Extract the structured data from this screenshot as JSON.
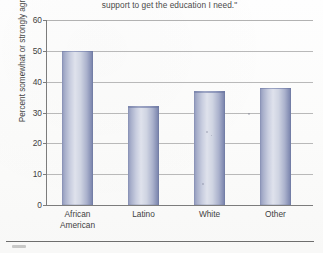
{
  "figure": {
    "title_fragment": "support to get the education I need.\"",
    "y_axis_title": "Percent somewhat or strongly agree"
  },
  "chart_data": {
    "type": "bar",
    "title": "support to get the education I need.\"",
    "xlabel": "",
    "ylabel": "Percent somewhat or strongly agree",
    "categories": [
      "African American",
      "Latino",
      "White",
      "Other"
    ],
    "category_lines": [
      [
        "African",
        "American"
      ],
      [
        "Latino"
      ],
      [
        "White"
      ],
      [
        "Other"
      ]
    ],
    "values": [
      50,
      32,
      37,
      38
    ],
    "ylim": [
      0,
      60
    ],
    "yticks": [
      0,
      10,
      20,
      30,
      40,
      50,
      60
    ],
    "ytick_labels": [
      "0",
      "10",
      "20",
      "30",
      "40",
      "50",
      "60"
    ],
    "grid": true,
    "legend": false,
    "bar_color": "#aab1cc",
    "bar_edge_color": "#6f7aa4",
    "axis_color": "#7c7c7c",
    "gridline_color": "#b9b9b9"
  }
}
